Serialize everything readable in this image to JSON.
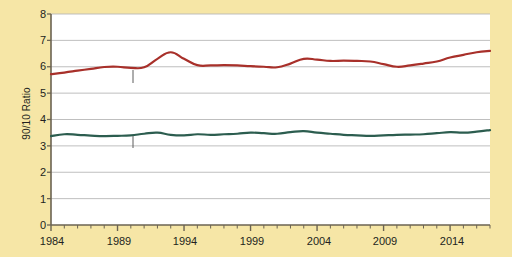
{
  "chart_data": {
    "type": "line",
    "title": "",
    "subtitle": "",
    "xlabel": "",
    "ylabel": "90/10 Ratio",
    "xlim": [
      1984,
      2017
    ],
    "ylim": [
      0,
      8
    ],
    "grid": true,
    "grid_axis": "y",
    "legend": "inline-annotations",
    "x_tick_labels": [
      "1984",
      "1989",
      "1994",
      "1999",
      "2004",
      "2009",
      "2014"
    ],
    "x_tick_values": [
      1984,
      1989,
      1994,
      1999,
      2004,
      2009,
      2014
    ],
    "x_minor_ticks_interval": 1,
    "y_tick_labels": [
      "0",
      "1",
      "2",
      "3",
      "4",
      "5",
      "6",
      "7",
      "8"
    ],
    "y_tick_values": [
      0,
      1,
      2,
      3,
      4,
      5,
      6,
      7,
      8
    ],
    "x": [
      1984,
      1985,
      1986,
      1987,
      1988,
      1989,
      1990,
      1991,
      1992,
      1993,
      1994,
      1995,
      1996,
      1997,
      1998,
      1999,
      2000,
      2001,
      2002,
      2003,
      2004,
      2005,
      2006,
      2007,
      2008,
      2009,
      2010,
      2011,
      2012,
      2013,
      2014,
      2015,
      2016,
      2017
    ],
    "series": [
      {
        "name": "After-Tax Income",
        "color": "#a8302a",
        "label_text": "After-Tax Income",
        "values": [
          5.72,
          5.78,
          5.85,
          5.92,
          5.99,
          6.0,
          5.96,
          5.98,
          6.3,
          6.55,
          6.3,
          6.06,
          6.05,
          6.06,
          6.05,
          6.02,
          6.0,
          5.98,
          6.12,
          6.3,
          6.27,
          6.22,
          6.23,
          6.22,
          6.2,
          6.1,
          6.0,
          6.05,
          6.12,
          6.2,
          6.35,
          6.45,
          6.55,
          6.6
        ]
      },
      {
        "name": "Expenditures",
        "color": "#2c5d4f",
        "label_text": "Expenditures",
        "values": [
          3.37,
          3.44,
          3.42,
          3.39,
          3.37,
          3.38,
          3.4,
          3.46,
          3.5,
          3.42,
          3.4,
          3.44,
          3.42,
          3.44,
          3.46,
          3.5,
          3.48,
          3.46,
          3.52,
          3.56,
          3.5,
          3.46,
          3.42,
          3.4,
          3.38,
          3.4,
          3.42,
          3.43,
          3.44,
          3.48,
          3.52,
          3.5,
          3.54,
          3.6
        ]
      }
    ],
    "annotations": [
      {
        "text": "After-Tax Income",
        "target_year": 1990,
        "leader": true
      },
      {
        "text": "Expenditures",
        "target_year": 1990,
        "leader": true
      }
    ]
  },
  "colors": {
    "background": "#f6e6a6",
    "plot_background": "#ffffff",
    "grid": "#b8b8b8",
    "axis": "#6b6352",
    "text": "#231f20",
    "after_tax_income": "#a8302a",
    "expenditures": "#2c5d4f"
  }
}
